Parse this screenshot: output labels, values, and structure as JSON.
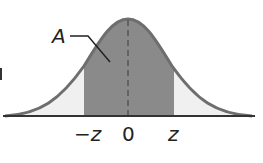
{
  "diagram": {
    "type": "standard-normal-curve",
    "area_label": "A",
    "x_labels": {
      "neg_z": "−z",
      "zero": "0",
      "pos_z": "z"
    },
    "colors": {
      "curve": "#6e6e6e",
      "shaded_region": "#8a8a8a",
      "tail_fill": "#f0f0f0",
      "axis": "#333333",
      "center_line": "#555555"
    },
    "shaded_interval": [
      "-z",
      "z"
    ]
  }
}
